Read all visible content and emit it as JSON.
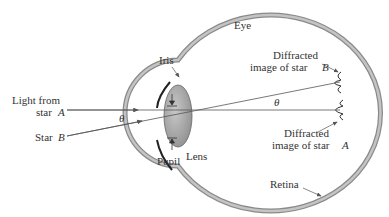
{
  "diagram": {
    "labels": {
      "eye": "Eye",
      "iris": "Iris",
      "pupil": "Pupil",
      "lens": "Lens",
      "retina": "Retina",
      "light_from_1": "Light from",
      "light_from_2": "star",
      "star_a_var": "A",
      "star_b_1": "Star",
      "star_b_var": "B",
      "theta_left": "θ",
      "theta_right": "θ",
      "diff_b_1": "Diffracted",
      "diff_b_2": "image of star",
      "diff_b_var": "B",
      "diff_a_1": "Diffracted",
      "diff_a_2": "image of star",
      "diff_a_var": "A"
    },
    "colors": {
      "eyeball_wall": "#9a9a9a",
      "lens_fill": "#a8a8a8",
      "line": "#555555",
      "text": "#333333"
    }
  }
}
